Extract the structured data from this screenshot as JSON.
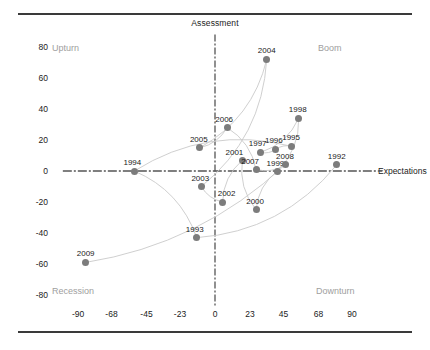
{
  "chart_data": {
    "type": "scatter",
    "title": "",
    "xlabel": "Expectations",
    "ylabel": "Assessment",
    "xlim": [
      -100,
      100
    ],
    "ylim": [
      -90,
      90
    ],
    "xticks": [
      "-90",
      "-68",
      "-45",
      "-23",
      "0",
      "23",
      "45",
      "68",
      "90"
    ],
    "xtick_values": [
      -90,
      -68,
      -45,
      -23,
      0,
      23,
      45,
      68,
      90
    ],
    "yticks": [
      "80",
      "60",
      "40",
      "20",
      "0",
      "-20",
      "-40",
      "-60",
      "-80"
    ],
    "ytick_values": [
      80,
      60,
      40,
      20,
      0,
      -20,
      -40,
      -60,
      -80
    ],
    "grid": false,
    "legend": "none",
    "quadrant_labels": [
      {
        "name": "upturn",
        "text": "Upturn"
      },
      {
        "name": "boom",
        "text": "Boom"
      },
      {
        "name": "recession",
        "text": "Recession"
      },
      {
        "name": "downturn",
        "text": "Downturn"
      }
    ],
    "points": [
      {
        "label": "1992",
        "x": 80,
        "y": 4
      },
      {
        "label": "1993",
        "x": -12,
        "y": -43
      },
      {
        "label": "1994",
        "x": -53,
        "y": 0
      },
      {
        "label": "1995",
        "x": 50,
        "y": 16
      },
      {
        "label": "1996",
        "x": 40,
        "y": 14
      },
      {
        "label": "1997",
        "x": 30,
        "y": 12
      },
      {
        "label": "1998",
        "x": 55,
        "y": 34
      },
      {
        "label": "1999",
        "x": 41,
        "y": 0
      },
      {
        "label": "2000",
        "x": 27,
        "y": -25
      },
      {
        "label": "2001",
        "x": 18,
        "y": 7
      },
      {
        "label": "2002",
        "x": 5,
        "y": -20
      },
      {
        "label": "2003",
        "x": -9,
        "y": -10
      },
      {
        "label": "2004",
        "x": 34,
        "y": 72
      },
      {
        "label": "2005",
        "x": -10,
        "y": 15
      },
      {
        "label": "2006",
        "x": 8,
        "y": 28
      },
      {
        "label": "2007",
        "x": 27,
        "y": 1
      },
      {
        "label": "2008",
        "x": 46,
        "y": 4
      },
      {
        "label": "2009",
        "x": -85,
        "y": -59
      }
    ]
  },
  "colors": {
    "marker": "#7c7c7c",
    "line": "#c9c9c9",
    "axis": "#555555",
    "quadrant_text": "#9e9e9e",
    "tick_text": "#1b1b1b",
    "rule": "#3a3a3a"
  }
}
